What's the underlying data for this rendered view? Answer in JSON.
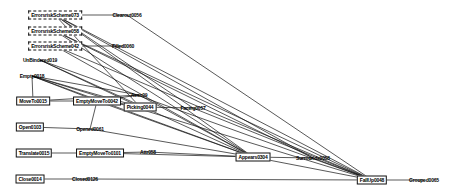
{
  "diagram": {
    "type": "node-link-graph",
    "title": "",
    "background": "#ffffff",
    "edge_color": "#111111",
    "node_text_color": "#000000",
    "width": 456,
    "height": 194,
    "nodes": [
      {
        "id": "n0",
        "label": "ErrorsriskScheme073",
        "x": 55,
        "y": 15,
        "style": "dashed"
      },
      {
        "id": "n1",
        "label": "ErrorsriskScheme058",
        "x": 55,
        "y": 31,
        "style": "dashed"
      },
      {
        "id": "n2",
        "label": "ErrorsriskScheme042",
        "x": 55,
        "y": 46,
        "style": "dashed"
      },
      {
        "id": "n3",
        "label": "UnBindered019",
        "x": 40,
        "y": 60,
        "style": "plain"
      },
      {
        "id": "n4",
        "label": "Empty0018",
        "x": 32,
        "y": 76,
        "style": "plain"
      },
      {
        "id": "n5",
        "label": "MoveTo0015",
        "x": 33,
        "y": 101,
        "style": "boxed"
      },
      {
        "id": "n6",
        "label": "EmptyMoveTo0042",
        "x": 97,
        "y": 101,
        "style": "boxed"
      },
      {
        "id": "n7",
        "label": "Open0103",
        "x": 30,
        "y": 127,
        "style": "boxed"
      },
      {
        "id": "n8",
        "label": "Opened0061",
        "x": 90,
        "y": 129,
        "style": "plain"
      },
      {
        "id": "n9",
        "label": "Translate0015",
        "x": 34,
        "y": 153,
        "style": "boxed"
      },
      {
        "id": "n10",
        "label": "EmptyMoveTo0101",
        "x": 100,
        "y": 153,
        "style": "boxed"
      },
      {
        "id": "n11",
        "label": "Close0014",
        "x": 30,
        "y": 179,
        "style": "boxed"
      },
      {
        "id": "n12",
        "label": "Closed0126",
        "x": 85,
        "y": 179,
        "style": "plain"
      },
      {
        "id": "n13",
        "label": "Clearout0056",
        "x": 127,
        "y": 15,
        "style": "plain"
      },
      {
        "id": "n14",
        "label": "Filled0060",
        "x": 123,
        "y": 46,
        "style": "plain"
      },
      {
        "id": "n15",
        "label": "Assn09",
        "x": 139,
        "y": 95,
        "style": "plain"
      },
      {
        "id": "n16",
        "label": "Picking0044",
        "x": 140,
        "y": 107,
        "style": "boxed"
      },
      {
        "id": "n17",
        "label": "Facing0057",
        "x": 193,
        "y": 108,
        "style": "plain"
      },
      {
        "id": "n18",
        "label": "Attr058",
        "x": 148,
        "y": 152,
        "style": "plain"
      },
      {
        "id": "n19",
        "label": "Appears0304",
        "x": 253,
        "y": 157,
        "style": "boxed"
      },
      {
        "id": "n20",
        "label": "Surrounds0056",
        "x": 313,
        "y": 158,
        "style": "plain"
      },
      {
        "id": "n21",
        "label": "FallUp0048",
        "x": 372,
        "y": 180,
        "style": "boxed"
      },
      {
        "id": "n22",
        "label": "Grouped0065",
        "x": 424,
        "y": 180,
        "style": "plain"
      }
    ],
    "edges": [
      {
        "from": "n0",
        "to": "n13"
      },
      {
        "from": "n0",
        "to": "n16"
      },
      {
        "from": "n0",
        "to": "n19"
      },
      {
        "from": "n0",
        "to": "n21"
      },
      {
        "from": "n0",
        "to": "n17"
      },
      {
        "from": "n0",
        "to": "n20"
      },
      {
        "from": "n1",
        "to": "n19"
      },
      {
        "from": "n1",
        "to": "n21"
      },
      {
        "from": "n1",
        "to": "n20"
      },
      {
        "from": "n2",
        "to": "n14"
      },
      {
        "from": "n2",
        "to": "n21"
      },
      {
        "from": "n2",
        "to": "n19"
      },
      {
        "from": "n3",
        "to": "n16"
      },
      {
        "from": "n3",
        "to": "n19"
      },
      {
        "from": "n3",
        "to": "n21"
      },
      {
        "from": "n4",
        "to": "n15"
      },
      {
        "from": "n4",
        "to": "n16"
      },
      {
        "from": "n4",
        "to": "n19"
      },
      {
        "from": "n4",
        "to": "n21"
      },
      {
        "from": "n4",
        "to": "n6"
      },
      {
        "from": "n4",
        "to": "n5"
      },
      {
        "from": "n5",
        "to": "n6"
      },
      {
        "from": "n5",
        "to": "n15"
      },
      {
        "from": "n6",
        "to": "n15"
      },
      {
        "from": "n6",
        "to": "n16"
      },
      {
        "from": "n6",
        "to": "n19"
      },
      {
        "from": "n7",
        "to": "n8"
      },
      {
        "from": "n8",
        "to": "n6"
      },
      {
        "from": "n8",
        "to": "n19"
      },
      {
        "from": "n9",
        "to": "n10"
      },
      {
        "from": "n10",
        "to": "n18"
      },
      {
        "from": "n10",
        "to": "n19"
      },
      {
        "from": "n11",
        "to": "n12"
      },
      {
        "from": "n12",
        "to": "n21"
      },
      {
        "from": "n16",
        "to": "n17"
      },
      {
        "from": "n18",
        "to": "n19"
      },
      {
        "from": "n19",
        "to": "n20"
      },
      {
        "from": "n19",
        "to": "n21"
      },
      {
        "from": "n20",
        "to": "n21"
      },
      {
        "from": "n21",
        "to": "n22"
      },
      {
        "from": "n17",
        "to": "n21"
      },
      {
        "from": "n15",
        "to": "n19"
      },
      {
        "from": "n13",
        "to": "n21"
      }
    ]
  }
}
